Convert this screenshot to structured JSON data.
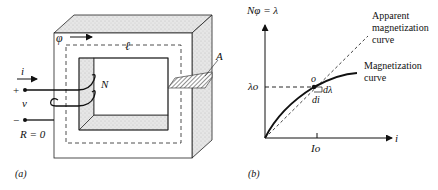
{
  "figure_a": {
    "label": "(a)",
    "flux_symbol": "φ",
    "length_symbol": "ℓ",
    "area_symbol": "A",
    "turns_symbol": "N",
    "current_symbol": "i",
    "voltage_symbol": "v",
    "plus_sign": "+",
    "minus_sign": "−",
    "resistance_label": "R = 0"
  },
  "figure_b": {
    "label": "(b)",
    "y_axis_label": "Nφ = λ",
    "x_axis_label": "i",
    "lambda_o": "λo",
    "I_o": "Io",
    "point_label": "o",
    "d_lambda": "dλ",
    "d_i": "di",
    "apparent_curve_label_1": "Apparent",
    "apparent_curve_label_2": "magnetization",
    "apparent_curve_label_3": "curve",
    "mag_curve_label_1": "Magnetization",
    "mag_curve_label_2": "curve"
  }
}
